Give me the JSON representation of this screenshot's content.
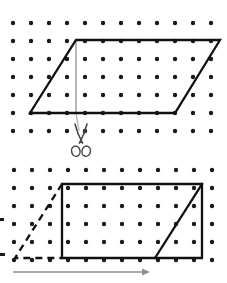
{
  "figure": {
    "title": "Parallelogram cut and rearranged into a rectangle",
    "caption_top": "",
    "caption_bottom": "",
    "background_color": "#ffffff",
    "ink_color": "#111111",
    "dot_color": "#1a1a1a",
    "accent_gray": "#9a9a9a",
    "dot_radius": 2.2,
    "stroke_width_shape": 2.3,
    "stroke_width_thin": 1.4
  },
  "top_panel": {
    "name": "parallelogram-panel",
    "dot_grid": {
      "origin_x": 13,
      "origin_y": 23,
      "spacing": 18,
      "cols": 12,
      "rows": 7
    },
    "parallelogram": {
      "label": "parallelogram",
      "points": "76,40 220,40 175,113 30,113",
      "vertices": [
        {
          "name": "top-left",
          "x": 76,
          "y": 40
        },
        {
          "name": "top-right",
          "x": 220,
          "y": 40
        },
        {
          "name": "bottom-right",
          "x": 175,
          "y": 113
        },
        {
          "name": "bottom-left",
          "x": 30,
          "y": 113
        }
      ]
    },
    "height_line": {
      "label": "height",
      "x1": 76,
      "y1": 40,
      "x2": 76,
      "y2": 113,
      "color": "#9a9a9a"
    },
    "cut_guide": {
      "label": "cut line continuation",
      "x1": 76,
      "y1": 113,
      "x2": 79,
      "y2": 130,
      "color": "#b5b5b5"
    }
  },
  "scissors": {
    "name": "scissors-icon",
    "label": "scissors",
    "x": 66,
    "y": 124,
    "width": 30,
    "height": 34,
    "color": "#4a4a4a"
  },
  "bottom_panel": {
    "name": "rectangle-panel",
    "dot_grid": {
      "origin_x": 14,
      "origin_y": 170,
      "spacing": 18,
      "cols": 12,
      "rows": 6
    },
    "rectangle": {
      "label": "rectangle",
      "points": "62,184 202,184 202,258 62,258",
      "vertices": [
        {
          "name": "top-left",
          "x": 62,
          "y": 184
        },
        {
          "name": "top-right",
          "x": 202,
          "y": 184
        },
        {
          "name": "bottom-right",
          "x": 202,
          "y": 258
        },
        {
          "name": "bottom-left",
          "x": 62,
          "y": 258
        }
      ]
    },
    "dashed_triangle": {
      "label": "removed triangle (dashed)",
      "points": "62,184 15,258 62,258",
      "dash_pattern": "7,5"
    },
    "moved_diagonal": {
      "label": "moved triangle diagonal",
      "x1": 155,
      "y1": 258,
      "x2": 202,
      "y2": 184
    },
    "base_arrow": {
      "label": "base arrow",
      "x1": 13,
      "y1": 272,
      "x2": 150,
      "y2": 272,
      "color": "#8e8e8e"
    }
  },
  "left_marks": [
    {
      "name": "left-edge-mark-top",
      "x": 0,
      "y": 218,
      "w": 4,
      "h": 3
    },
    {
      "name": "left-edge-mark-bottom",
      "x": 0,
      "y": 253,
      "w": 5,
      "h": 3
    }
  ]
}
